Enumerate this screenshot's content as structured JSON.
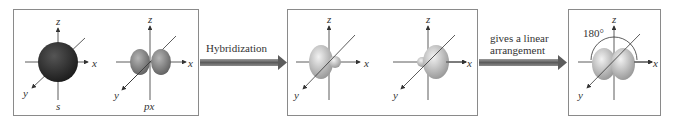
{
  "diagram": {
    "panels": [
      {
        "name": "atomic-orbitals",
        "orbitals": [
          {
            "label": "s"
          },
          {
            "label": "px"
          }
        ]
      },
      {
        "name": "sp-hybrid-orbitals",
        "orbitals": [
          {
            "label": ""
          },
          {
            "label": ""
          }
        ]
      },
      {
        "name": "linear-arrangement",
        "angle_label": "180°"
      }
    ],
    "axes": {
      "x": "x",
      "y": "y",
      "z": "z"
    },
    "arrows": [
      {
        "label": "Hybridization"
      },
      {
        "label_line1": "gives a linear",
        "label_line2": "arrangement"
      }
    ],
    "colors": {
      "s_orbital": "#2a2a2a",
      "p_orbital": "#8f8f8f",
      "hybrid_lobe": "#c9c9c9",
      "arrow": "#6a6a6a",
      "border": "#8a8a8a"
    }
  }
}
